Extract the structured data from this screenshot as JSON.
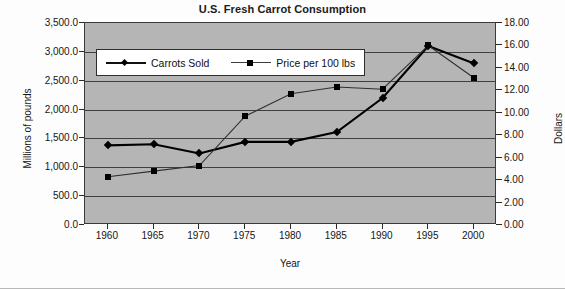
{
  "chart_data": {
    "type": "line",
    "title": "U.S. Fresh Carrot Consumption",
    "xlabel": "Year",
    "ylabel": "Millions of pounds",
    "y2label": "Dollars",
    "grid": true,
    "legend_position": "top-left-inside",
    "x": [
      1960,
      1965,
      1970,
      1975,
      1980,
      1985,
      1990,
      1995,
      2000
    ],
    "xtick_labels": [
      "1960",
      "1965",
      "1970",
      "1975",
      "1980",
      "1985",
      "1990",
      "1995",
      "2000"
    ],
    "xlim": [
      1957.5,
      2002.5
    ],
    "ylim": [
      0,
      3500
    ],
    "ytick_labels": [
      "0.0",
      "500.0",
      "1,000.0",
      "1,500.0",
      "2,000.0",
      "2,500.0",
      "3,000.0",
      "3,500.0"
    ],
    "ytick_values": [
      0,
      500,
      1000,
      1500,
      2000,
      2500,
      3000,
      3500
    ],
    "y2lim": [
      0,
      18
    ],
    "y2tick_labels": [
      "0.00",
      "2.00",
      "4.00",
      "6.00",
      "8.00",
      "10.00",
      "12.00",
      "14.00",
      "16.00",
      "18.00"
    ],
    "y2tick_values": [
      0,
      2,
      4,
      6,
      8,
      10,
      12,
      14,
      16,
      18
    ],
    "series": [
      {
        "name": "Carrots Sold",
        "axis": "left",
        "marker": "diamond",
        "values": [
          1380,
          1400,
          1240,
          1440,
          1440,
          1610,
          2200,
          3100,
          2800
        ]
      },
      {
        "name": "Price per 100 lbs",
        "axis": "right",
        "marker": "square",
        "values": [
          4.3,
          4.8,
          5.3,
          9.7,
          11.7,
          12.3,
          12.1,
          16.0,
          13.1
        ]
      }
    ],
    "legend": [
      {
        "label": "Carrots Sold",
        "marker": "diamond"
      },
      {
        "label": "Price per 100 lbs",
        "marker": "square"
      }
    ]
  }
}
